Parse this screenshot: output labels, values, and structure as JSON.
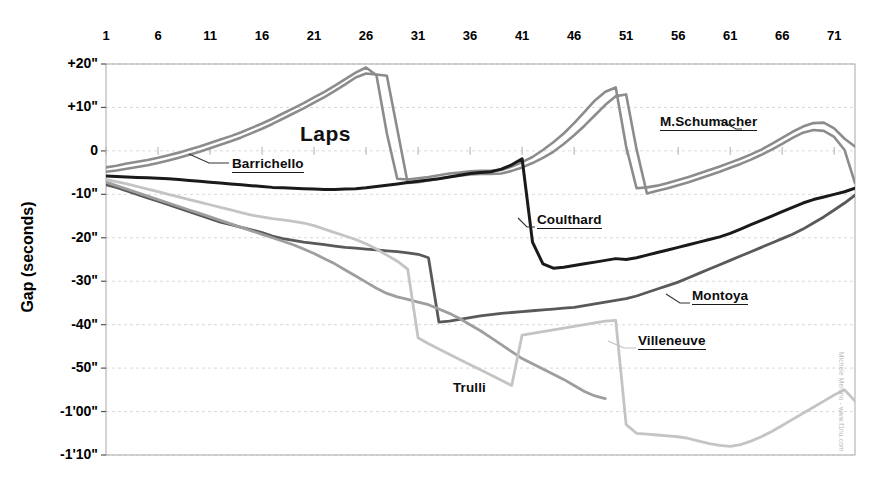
{
  "chart_data": {
    "type": "line",
    "title": "Laps",
    "xlabel": "Laps",
    "ylabel": "Gap (seconds)",
    "xlim": [
      1,
      73
    ],
    "ylim": [
      -70,
      20
    ],
    "grid": true,
    "legend_position": "inline-annotations",
    "x_tick_labels": [
      "1",
      "6",
      "11",
      "16",
      "21",
      "26",
      "31",
      "36",
      "41",
      "46",
      "51",
      "56",
      "61",
      "66",
      "71"
    ],
    "x_tick_values": [
      1,
      6,
      11,
      16,
      21,
      26,
      31,
      36,
      41,
      46,
      51,
      56,
      61,
      66,
      71
    ],
    "y_tick_labels": [
      "+20\"",
      "+10\"",
      "0",
      "-10\"",
      "-20\"",
      "-30\"",
      "-40\"",
      "-50\"",
      "-1'00\"",
      "-1'10\""
    ],
    "y_tick_values": [
      20,
      10,
      0,
      -10,
      -20,
      -30,
      -40,
      -50,
      -60,
      -70
    ],
    "annotations": [
      {
        "text": "Laps",
        "kind": "heading"
      },
      {
        "text": "Barrichello",
        "kind": "series-label",
        "underlined": true
      },
      {
        "text": "M.Schumacher",
        "kind": "series-label",
        "underlined": true
      },
      {
        "text": "Coulthard",
        "kind": "series-label",
        "underlined": true
      },
      {
        "text": "Montoya",
        "kind": "series-label",
        "underlined": true
      },
      {
        "text": "Villeneuve",
        "kind": "series-label",
        "underlined": true
      },
      {
        "text": "Trulli",
        "kind": "series-label",
        "underlined": false
      }
    ],
    "watermark": "Michele Merlino - www.f1nu.com",
    "series": [
      {
        "name": "M.Schumacher",
        "color": "#8c8c8c",
        "width": 2.6,
        "x": [
          1,
          2,
          3,
          4,
          5,
          6,
          7,
          8,
          9,
          10,
          11,
          12,
          13,
          14,
          15,
          16,
          17,
          18,
          19,
          20,
          21,
          22,
          23,
          24,
          25,
          26,
          27,
          28,
          29,
          30,
          31,
          32,
          33,
          34,
          35,
          36,
          37,
          38,
          39,
          40,
          41,
          42,
          43,
          44,
          45,
          46,
          47,
          48,
          49,
          50,
          51,
          52,
          53,
          54,
          55,
          56,
          57,
          58,
          59,
          60,
          61,
          62,
          63,
          64,
          65,
          66,
          67,
          68,
          69,
          70,
          71,
          72,
          73
        ],
        "y": [
          -3.8,
          -3.4,
          -2.9,
          -2.5,
          -2.1,
          -1.6,
          -1.0,
          -0.4,
          0.3,
          1.0,
          1.8,
          2.6,
          3.4,
          4.3,
          5.3,
          6.3,
          7.4,
          8.6,
          9.8,
          11.0,
          12.3,
          13.6,
          15.0,
          16.5,
          18.0,
          19.2,
          17.4,
          4.0,
          -6.4,
          -6.6,
          -6.3,
          -6.0,
          -5.6,
          -5.2,
          -5.0,
          -4.7,
          -4.6,
          -4.6,
          -4.4,
          -3.6,
          -2.6,
          -1.4,
          0.2,
          2.0,
          4.0,
          6.4,
          9.0,
          11.6,
          13.6,
          14.6,
          1.0,
          -8.6,
          -8.4,
          -8.0,
          -7.4,
          -6.7,
          -6.0,
          -5.2,
          -4.4,
          -3.6,
          -2.7,
          -1.8,
          -0.8,
          0.3,
          1.6,
          3.0,
          4.4,
          5.6,
          6.4,
          6.5,
          5.2,
          2.8,
          1.0
        ]
      },
      {
        "name": "Barrichello",
        "color": "#8c8c8c",
        "width": 2.6,
        "x": [
          1,
          2,
          3,
          4,
          5,
          6,
          7,
          8,
          9,
          10,
          11,
          12,
          13,
          14,
          15,
          16,
          17,
          18,
          19,
          20,
          21,
          22,
          23,
          24,
          25,
          26,
          27,
          28,
          29,
          30,
          31,
          32,
          33,
          34,
          35,
          36,
          37,
          38,
          39,
          40,
          41,
          42,
          43,
          44,
          45,
          46,
          47,
          48,
          49,
          50,
          51,
          52,
          53,
          54,
          55,
          56,
          57,
          58,
          59,
          60,
          61,
          62,
          63,
          64,
          65,
          66,
          67,
          68,
          69,
          70,
          71,
          72,
          73
        ],
        "y": [
          -4.8,
          -4.5,
          -4.1,
          -3.7,
          -3.3,
          -2.8,
          -2.2,
          -1.6,
          -0.9,
          -0.2,
          0.6,
          1.4,
          2.2,
          3.1,
          4.1,
          5.1,
          6.2,
          7.4,
          8.6,
          9.8,
          11.1,
          12.4,
          13.8,
          15.3,
          16.9,
          17.8,
          17.6,
          17.3,
          5.0,
          -7.4,
          -7.2,
          -6.8,
          -6.4,
          -6.0,
          -5.7,
          -5.4,
          -5.3,
          -5.3,
          -5.2,
          -4.6,
          -3.8,
          -2.8,
          -1.6,
          -0.2,
          1.6,
          3.6,
          5.8,
          8.2,
          10.6,
          12.6,
          13.0,
          0.4,
          -9.8,
          -9.2,
          -8.6,
          -7.9,
          -7.2,
          -6.4,
          -5.6,
          -4.8,
          -3.9,
          -3.0,
          -2.0,
          -0.9,
          0.3,
          1.6,
          3.0,
          4.2,
          4.8,
          4.6,
          3.2,
          0.2,
          -7.4
        ]
      },
      {
        "name": "Coulthard",
        "color": "#1a1a1a",
        "width": 3.0,
        "x": [
          1,
          2,
          3,
          4,
          5,
          6,
          7,
          8,
          9,
          10,
          11,
          12,
          13,
          14,
          15,
          16,
          17,
          18,
          19,
          20,
          21,
          22,
          23,
          24,
          25,
          26,
          27,
          28,
          29,
          30,
          31,
          32,
          33,
          34,
          35,
          36,
          37,
          38,
          39,
          40,
          41,
          42,
          43,
          44,
          45,
          46,
          47,
          48,
          49,
          50,
          51,
          52,
          53,
          54,
          55,
          56,
          57,
          58,
          59,
          60,
          61,
          62,
          63,
          64,
          65,
          66,
          67,
          68,
          69,
          70,
          71,
          72,
          73
        ],
        "y": [
          -5.8,
          -5.9,
          -6.0,
          -6.1,
          -6.2,
          -6.3,
          -6.4,
          -6.6,
          -6.8,
          -7.0,
          -7.2,
          -7.4,
          -7.6,
          -7.8,
          -8.0,
          -8.2,
          -8.4,
          -8.5,
          -8.6,
          -8.7,
          -8.8,
          -8.9,
          -8.9,
          -8.8,
          -8.7,
          -8.5,
          -8.2,
          -7.9,
          -7.6,
          -7.3,
          -7.0,
          -6.7,
          -6.4,
          -6.0,
          -5.6,
          -5.2,
          -5.0,
          -4.8,
          -4.2,
          -3.2,
          -1.8,
          -21.0,
          -26.0,
          -27.0,
          -26.8,
          -26.4,
          -26.0,
          -25.6,
          -25.2,
          -24.8,
          -25.0,
          -24.6,
          -24.0,
          -23.4,
          -22.8,
          -22.2,
          -21.6,
          -21.0,
          -20.4,
          -19.8,
          -19.0,
          -18.0,
          -17.0,
          -16.0,
          -15.0,
          -14.0,
          -13.0,
          -12.0,
          -11.2,
          -10.6,
          -10.0,
          -9.4,
          -8.6
        ]
      },
      {
        "name": "Montoya",
        "color": "#595959",
        "width": 2.8,
        "x": [
          1,
          2,
          3,
          4,
          5,
          6,
          7,
          8,
          9,
          10,
          11,
          12,
          13,
          14,
          15,
          16,
          17,
          18,
          19,
          20,
          21,
          22,
          23,
          24,
          25,
          26,
          27,
          28,
          29,
          30,
          31,
          32,
          33,
          34,
          35,
          36,
          37,
          38,
          39,
          40,
          41,
          42,
          43,
          44,
          45,
          46,
          47,
          48,
          49,
          50,
          51,
          52,
          53,
          54,
          55,
          56,
          57,
          58,
          59,
          60,
          61,
          62,
          63,
          64,
          65,
          66,
          67,
          68,
          69,
          70,
          71,
          72,
          73
        ],
        "y": [
          -7.8,
          -8.4,
          -9.2,
          -10.0,
          -10.8,
          -11.6,
          -12.4,
          -13.2,
          -14.0,
          -14.8,
          -15.6,
          -16.4,
          -17.0,
          -17.6,
          -18.2,
          -18.8,
          -19.6,
          -20.2,
          -20.6,
          -21.0,
          -21.3,
          -21.6,
          -21.9,
          -22.2,
          -22.4,
          -22.6,
          -22.8,
          -23.0,
          -23.2,
          -23.5,
          -23.8,
          -24.6,
          -39.4,
          -39.2,
          -38.8,
          -38.4,
          -38.0,
          -37.7,
          -37.4,
          -37.2,
          -37.0,
          -36.8,
          -36.6,
          -36.4,
          -36.2,
          -36.0,
          -35.6,
          -35.2,
          -34.8,
          -34.4,
          -34.0,
          -33.4,
          -32.6,
          -31.8,
          -31.0,
          -30.2,
          -29.2,
          -28.2,
          -27.2,
          -26.2,
          -25.2,
          -24.2,
          -23.2,
          -22.2,
          -21.2,
          -20.2,
          -19.2,
          -18.0,
          -16.6,
          -15.2,
          -13.6,
          -12.0,
          -10.2
        ]
      },
      {
        "name": "Trulli",
        "color": "#9e9e9e",
        "width": 2.8,
        "x": [
          1,
          2,
          3,
          4,
          5,
          6,
          7,
          8,
          9,
          10,
          11,
          12,
          13,
          14,
          15,
          16,
          17,
          18,
          19,
          20,
          21,
          22,
          23,
          24,
          25,
          26,
          27,
          28,
          29,
          30,
          31,
          32,
          33,
          34,
          35,
          36,
          37,
          38,
          39,
          40,
          41,
          42,
          43,
          44,
          45,
          46,
          47,
          48,
          49
        ],
        "y": [
          -7.2,
          -8.0,
          -8.8,
          -9.6,
          -10.4,
          -11.2,
          -12.0,
          -12.8,
          -13.6,
          -14.4,
          -15.2,
          -16.0,
          -16.8,
          -17.6,
          -18.4,
          -19.2,
          -20.0,
          -20.8,
          -21.6,
          -22.6,
          -23.6,
          -24.8,
          -26.0,
          -27.4,
          -28.8,
          -30.2,
          -31.6,
          -32.8,
          -33.6,
          -34.2,
          -34.8,
          -35.4,
          -36.4,
          -37.4,
          -38.6,
          -40.0,
          -41.4,
          -43.0,
          -44.6,
          -46.2,
          -47.8,
          -49.0,
          -50.2,
          -51.4,
          -52.6,
          -54.0,
          -55.4,
          -56.4,
          -57.0
        ]
      },
      {
        "name": "Villeneuve",
        "color": "#c4c4c4",
        "width": 2.8,
        "x": [
          1,
          2,
          3,
          4,
          5,
          6,
          7,
          8,
          9,
          10,
          11,
          12,
          13,
          14,
          15,
          16,
          17,
          18,
          19,
          20,
          21,
          22,
          23,
          24,
          25,
          26,
          27,
          28,
          29,
          30,
          31,
          32,
          33,
          34,
          35,
          36,
          37,
          38,
          39,
          40,
          41,
          42,
          43,
          44,
          45,
          46,
          47,
          48,
          49,
          50,
          51,
          52,
          53,
          54,
          55,
          56,
          57,
          58,
          59,
          60,
          61,
          62,
          63,
          64,
          65,
          66,
          67,
          68,
          69,
          70,
          71,
          72,
          73
        ],
        "y": [
          -6.6,
          -7.1,
          -7.6,
          -8.2,
          -8.8,
          -9.4,
          -10.0,
          -10.6,
          -11.2,
          -11.8,
          -12.4,
          -13.0,
          -13.6,
          -14.2,
          -14.8,
          -15.2,
          -15.6,
          -15.9,
          -16.2,
          -16.6,
          -17.2,
          -18.0,
          -18.8,
          -19.6,
          -20.4,
          -21.4,
          -22.6,
          -24.0,
          -25.4,
          -27.2,
          -43.0,
          -44.4,
          -45.6,
          -46.8,
          -48.0,
          -49.2,
          -50.4,
          -51.6,
          -52.8,
          -54.0,
          -42.4,
          -42.0,
          -41.6,
          -41.2,
          -40.8,
          -40.4,
          -40.0,
          -39.6,
          -39.2,
          -39.0,
          -63.0,
          -65.0,
          -65.2,
          -65.4,
          -65.6,
          -65.8,
          -66.2,
          -66.8,
          -67.4,
          -67.8,
          -68.0,
          -67.6,
          -66.8,
          -65.8,
          -64.6,
          -63.2,
          -61.8,
          -60.4,
          -59.0,
          -57.6,
          -56.2,
          -55.0,
          -57.6
        ]
      }
    ]
  },
  "styling": {
    "plot_border_color": "#9a9a9a",
    "grid_color": "#cfcfcf",
    "axis_color": "#808080",
    "background": "#ffffff"
  }
}
